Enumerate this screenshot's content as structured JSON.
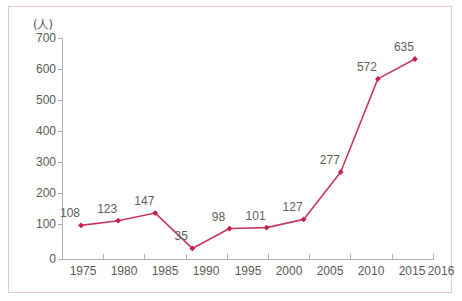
{
  "figure": {
    "background_color": "#ffffff",
    "border_color": "#e9c7cf",
    "label_text_color": "#5a5a5a"
  },
  "axes": {
    "y_unit_label": "(人)",
    "y_ticks": [
      "0",
      "100",
      "200",
      "300",
      "400",
      "500",
      "600",
      "700"
    ],
    "x_ticks": [
      "1975",
      "1980",
      "1985",
      "1990",
      "1995",
      "2000",
      "2005",
      "2010",
      "2015",
      "2016"
    ],
    "axis_line_color": "#b2b2b2"
  },
  "series": {
    "line_color": "#c8385f",
    "marker_color": "#c4204a",
    "point_labels": [
      "108",
      "123",
      "147",
      "35",
      "98",
      "101",
      "127",
      "277",
      "572",
      "635"
    ]
  },
  "chart_data": {
    "type": "line",
    "title": "",
    "subtitle": "",
    "xlabel": "",
    "ylabel": "(人)",
    "categories": [
      "1975",
      "1980",
      "1985",
      "1990",
      "1995",
      "2000",
      "2005",
      "2010",
      "2015",
      "2016"
    ],
    "x": [
      1975,
      1980,
      1985,
      1990,
      1995,
      2000,
      2005,
      2010,
      2015,
      2016
    ],
    "values": [
      108,
      123,
      147,
      35,
      98,
      101,
      127,
      277,
      572,
      635
    ],
    "data_labels": [
      "108",
      "123",
      "147",
      "35",
      "98",
      "101",
      "127",
      "277",
      "572",
      "635"
    ],
    "series": [
      {
        "name": "",
        "values": [
          108,
          123,
          147,
          35,
          98,
          101,
          127,
          277,
          572,
          635
        ],
        "color": "#c8385f",
        "marker": "diamond"
      }
    ],
    "ylim": [
      0,
      700
    ],
    "ytick_values": [
      0,
      100,
      200,
      300,
      400,
      500,
      600,
      700
    ],
    "ytick_labels": [
      "0",
      "100",
      "200",
      "300",
      "400",
      "500",
      "600",
      "700"
    ],
    "xtick_labels": [
      "1975",
      "1980",
      "1985",
      "1990",
      "1995",
      "2000",
      "2005",
      "2010",
      "2015",
      "2016"
    ],
    "grid": false,
    "legend": false,
    "legend_position": "none",
    "annotations": [],
    "note": "Categorical x-axis: evenly spaced year categories; each data point carries its value as a label above-left of the marker."
  }
}
